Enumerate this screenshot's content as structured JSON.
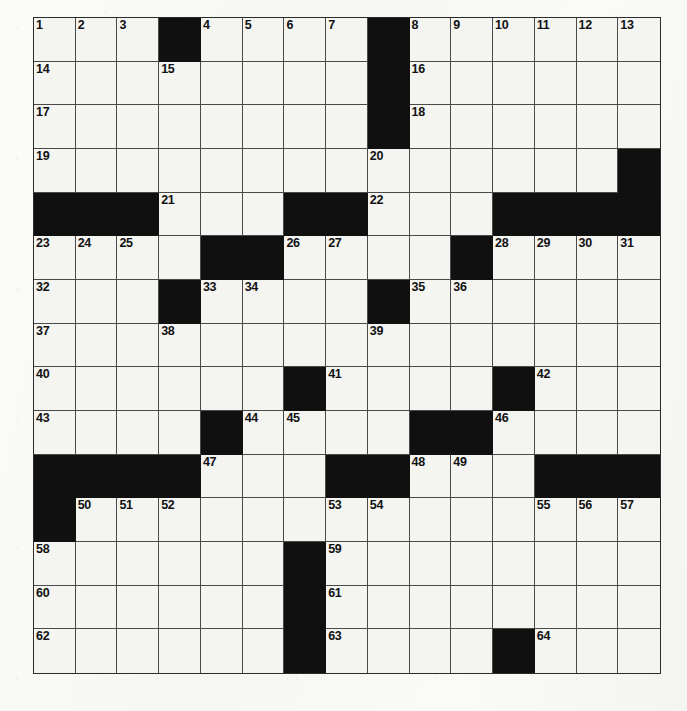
{
  "puzzle": {
    "type": "crossword-grid",
    "title": "",
    "rows": 15,
    "cols": 15,
    "colors": {
      "block": "#101010",
      "cell": "#f4f4f1",
      "grid_line": "#4a4a4a",
      "border": "#2b2b2b",
      "number_text": "#111111",
      "page_background": "#fdfdfb"
    },
    "highest_clue_number": 64,
    "block_count": 62,
    "grid": [
      [
        "1",
        "2",
        "3",
        "#",
        "4",
        "5",
        "6",
        "7",
        "#",
        "8",
        "9",
        "10",
        "11",
        "12",
        "13"
      ],
      [
        "14",
        "",
        "",
        "15",
        "",
        "",
        "",
        "",
        "#",
        "16",
        "",
        "",
        "",
        "",
        ""
      ],
      [
        "17",
        "",
        "",
        "",
        "",
        "",
        "",
        "",
        "#",
        "18",
        "",
        "",
        "",
        "",
        ""
      ],
      [
        "19",
        "",
        "",
        "",
        "",
        "",
        "",
        "",
        "20",
        "",
        "",
        "",
        "",
        "",
        "#"
      ],
      [
        "#",
        "#",
        "#",
        "21",
        "",
        "",
        "#",
        "#",
        "22",
        "",
        "",
        "#",
        "#",
        "#",
        "#"
      ],
      [
        "23",
        "24",
        "25",
        "",
        "#",
        "#",
        "26",
        "27",
        "",
        "",
        "#",
        "28",
        "29",
        "30",
        "31"
      ],
      [
        "32",
        "",
        "",
        "#",
        "33",
        "34",
        "",
        "",
        "#",
        "35",
        "36",
        "",
        "",
        "",
        ""
      ],
      [
        "37",
        "",
        "",
        "38",
        "",
        "",
        "",
        "",
        "39",
        "",
        "",
        "",
        "",
        "",
        ""
      ],
      [
        "40",
        "",
        "",
        "",
        "",
        "",
        "#",
        "41",
        "",
        "",
        "",
        "#",
        "42",
        "",
        ""
      ],
      [
        "43",
        "",
        "",
        "",
        "#",
        "44",
        "45",
        "",
        "",
        "#",
        "#",
        "46",
        "",
        "",
        ""
      ],
      [
        "#",
        "#",
        "#",
        "#",
        "47",
        "",
        "",
        "#",
        "#",
        "48",
        "49",
        "",
        "#",
        "#",
        "#"
      ],
      [
        "#",
        "50",
        "51",
        "52",
        "",
        "",
        "",
        "53",
        "54",
        "",
        "",
        "",
        "55",
        "56",
        "57"
      ],
      [
        "58",
        "",
        "",
        "",
        "",
        "",
        "#",
        "59",
        "",
        "",
        "",
        "",
        "",
        "",
        ""
      ],
      [
        "60",
        "",
        "",
        "",
        "",
        "",
        "#",
        "61",
        "",
        "",
        "",
        "",
        "",
        "",
        ""
      ],
      [
        "62",
        "",
        "",
        "",
        "",
        "",
        "#",
        "63",
        "",
        "",
        "",
        "#",
        "64",
        "",
        ""
      ]
    ],
    "clue_numbers_across": [
      "1",
      "14",
      "17",
      "19",
      "21",
      "22",
      "23",
      "26",
      "28",
      "32",
      "33",
      "35",
      "37",
      "38",
      "39",
      "40",
      "41",
      "42",
      "43",
      "44",
      "46",
      "47",
      "48",
      "50",
      "53",
      "55",
      "58",
      "59",
      "60",
      "61",
      "62",
      "63",
      "64"
    ],
    "clue_numbers_down": [
      "1",
      "2",
      "3",
      "4",
      "5",
      "6",
      "7",
      "8",
      "9",
      "10",
      "11",
      "12",
      "13",
      "15",
      "16",
      "18",
      "20",
      "24",
      "25",
      "27",
      "29",
      "30",
      "31",
      "34",
      "36",
      "45",
      "49",
      "51",
      "52",
      "54",
      "56",
      "57"
    ]
  }
}
